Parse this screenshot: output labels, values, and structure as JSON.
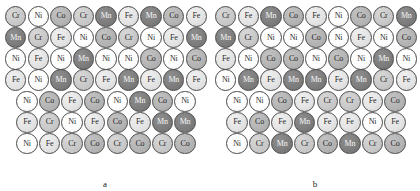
{
  "figure": {
    "caption_a": "a",
    "caption_b": "b",
    "elements": [
      "Cr",
      "Mn",
      "Fe",
      "Co",
      "Ni"
    ],
    "element_colors": {
      "Ni": "#ffffff",
      "Fe": "#e4e4e4",
      "Cr": "#c9c9c9",
      "Co": "#b4b4b4",
      "Mn": "#7e7e7e"
    },
    "outline_color": "#4a4a4a"
  },
  "panel_a": {
    "label": "a",
    "rows": [
      {
        "offset": 0,
        "atoms": [
          "Cr",
          "Ni",
          "Co",
          "Cr",
          "Mn",
          "Fe",
          "Mn",
          "Co",
          "Fe"
        ]
      },
      {
        "offset": 0,
        "atoms": [
          "Mn",
          "Cr",
          "Fe",
          "Ni",
          "Co",
          "Cr",
          "Ni",
          "Fe",
          "Mn"
        ]
      },
      {
        "offset": 0,
        "atoms": [
          "Ni",
          "Fe",
          "Ni",
          "Mn",
          "Ni",
          "Ni",
          "Co",
          "Ni",
          "Co"
        ]
      },
      {
        "offset": 0,
        "atoms": [
          "Fe",
          "Ni",
          "Mn",
          "Cr",
          "Fe",
          "Mn",
          "Fe",
          "Mn",
          "Fe"
        ]
      },
      {
        "offset": 1,
        "atoms": [
          "Ni",
          "Co",
          "Fe",
          "Co",
          "Ni",
          "Mn",
          "Co",
          "Ni"
        ]
      },
      {
        "offset": 1,
        "atoms": [
          "Fe",
          "Cr",
          "Ni",
          "Fe",
          "Co",
          "Fe",
          "Mn",
          "Mn"
        ]
      },
      {
        "offset": 1,
        "atoms": [
          "Ni",
          "Fe",
          "Cr",
          "Co",
          "Cr",
          "Co",
          "Cr",
          "Co"
        ]
      }
    ]
  },
  "panel_b": {
    "label": "b",
    "rows": [
      {
        "offset": 0,
        "atoms": [
          "Cr",
          "Fe",
          "Mn",
          "Co",
          "Fe",
          "Ni",
          "Co",
          "Cr",
          "Mn"
        ]
      },
      {
        "offset": 0,
        "atoms": [
          "Mn",
          "Cr",
          "Ni",
          "Ni",
          "Co",
          "Ni",
          "Fe",
          "Ni",
          "Co"
        ]
      },
      {
        "offset": 0,
        "atoms": [
          "Fe",
          "Ni",
          "Co",
          "Co",
          "Ni",
          "Co",
          "Ni",
          "Mn",
          "Ni"
        ]
      },
      {
        "offset": 0,
        "atoms": [
          "Ni",
          "Mn",
          "Fe",
          "Mn",
          "Mn",
          "Fe",
          "Mn",
          "Cr",
          "Fe"
        ]
      },
      {
        "offset": 1,
        "atoms": [
          "Ni",
          "Ni",
          "Co",
          "Fe",
          "Cr",
          "Cr",
          "Fe",
          "Co"
        ]
      },
      {
        "offset": 1,
        "atoms": [
          "Fe",
          "Co",
          "Fe",
          "Mn",
          "Fe",
          "Fe",
          "Ni",
          "Fe"
        ]
      },
      {
        "offset": 1,
        "atoms": [
          "Ni",
          "Cr",
          "Mn",
          "Cr",
          "Co",
          "Mn",
          "Cr",
          "Co"
        ]
      }
    ]
  }
}
